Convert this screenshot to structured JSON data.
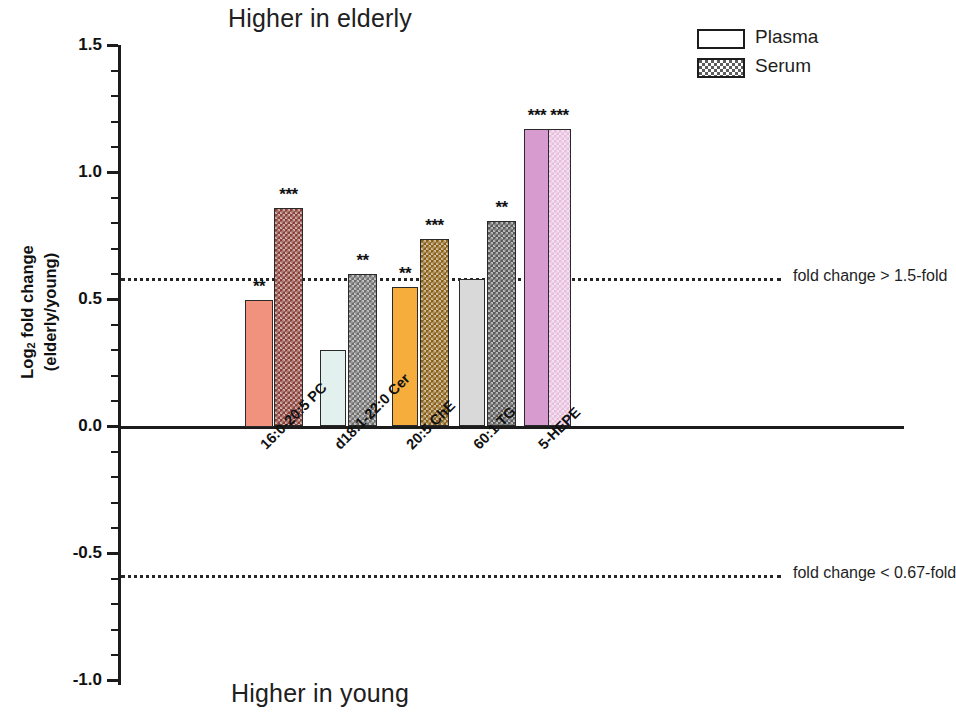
{
  "titles": {
    "top": "Higher in elderly",
    "bottom": "Higher in young"
  },
  "axis": {
    "ylabel_line1": "Log",
    "ylabel_sub": "2",
    "ylabel_line1b": " fold change",
    "ylabel_line2": "(elderly/young)",
    "yticks": [
      "1.5",
      "1.0",
      "0.5",
      "0.0",
      "-0.5",
      "-1.0"
    ]
  },
  "legend": {
    "items": [
      {
        "label": "Plasma",
        "pattern": "solid-outline"
      },
      {
        "label": "Serum",
        "pattern": "checkered"
      }
    ]
  },
  "thresholds": [
    {
      "label": "fold change > 1.5-fold",
      "value": 0.585
    },
    {
      "label": "fold change < 0.67-fold",
      "value": -0.585
    }
  ],
  "chart_data": {
    "type": "bar",
    "title": "Higher in elderly",
    "subtitle": "Higher in young",
    "xlabel": "",
    "ylabel": "Log2 fold change (elderly/young)",
    "ylim": [
      -1.0,
      1.5
    ],
    "yticks": [
      -1.0,
      -0.5,
      0.0,
      0.5,
      1.0,
      1.5
    ],
    "grid": false,
    "legend_position": "top-right",
    "categories": [
      "16:0-20:5 PC",
      "d18:1-22:0 Cer",
      "20:5 ChE",
      "60:1 TG",
      "5-HEPE"
    ],
    "series": [
      {
        "name": "Plasma",
        "values": [
          0.5,
          0.3,
          0.55,
          0.58,
          1.17
        ],
        "significance": [
          "**",
          "",
          "**",
          "",
          "***"
        ],
        "colors": [
          "#f0927e",
          "#e2f0ee",
          "#f7ad3c",
          "#d9d9d9",
          "#d79bd0"
        ]
      },
      {
        "name": "Serum",
        "values": [
          0.86,
          0.6,
          0.74,
          0.81,
          1.17
        ],
        "significance": [
          "***",
          "**",
          "***",
          "**",
          "***"
        ],
        "colors": [
          "#8a4139",
          "#6e6e6e",
          "#8a6018",
          "#5a5a5a",
          "#e8bede"
        ]
      }
    ],
    "annotations": [
      {
        "text": "fold change > 1.5-fold",
        "y": 0.585,
        "style": "dotted-line"
      },
      {
        "text": "fold change < 0.67-fold",
        "y": -0.585,
        "style": "dotted-line"
      }
    ]
  }
}
